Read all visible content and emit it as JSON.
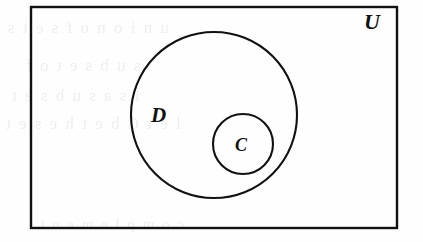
{
  "figure": {
    "kind": "euler-diagram",
    "background_color": "#fefefe",
    "ink_color": "#111111"
  },
  "labels": {
    "universe": "U",
    "outer_set": "D",
    "inner_set": "C"
  },
  "geometry": {
    "universe_rect": {
      "x": 31,
      "y": 7,
      "width": 366,
      "height": 221,
      "stroke_width": 2.4
    },
    "set_d_circle": {
      "cx": 214,
      "cy": 115,
      "r": 83,
      "stroke_width": 2.1
    },
    "set_c_circle": {
      "cx": 243,
      "cy": 144,
      "r": 30,
      "stroke_width": 2.1
    }
  },
  "bleed_through_text": {
    "line1": "u n i o n   o f   s e t s",
    "line2": "s u b s e t   o f",
    "line3": "i s   a   s u b s e t",
    "line4": "l e t   C   b e   t h e   s e t",
    "line5": "c o m p l e m e n t"
  }
}
